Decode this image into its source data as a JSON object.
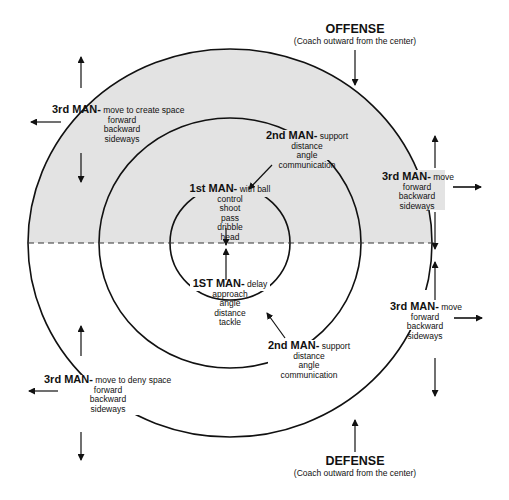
{
  "offense": {
    "title": "OFFENSE",
    "subtitle": "(Coach outward from the center)"
  },
  "defense": {
    "title": "DEFENSE",
    "subtitle": "(Coach outward from the center)"
  },
  "colors": {
    "offense_fill": "#e3e3e3",
    "line": "#111111",
    "background": "#ffffff"
  },
  "labels": {
    "off_first": {
      "role": "1st MAN-",
      "desc": "with ball",
      "items": [
        "control",
        "shoot",
        "pass",
        "dribble",
        "head"
      ]
    },
    "off_second": {
      "role": "2nd MAN-",
      "desc": "support",
      "items": [
        "distance",
        "angle",
        "communication"
      ]
    },
    "off_third_left": {
      "role": "3rd MAN-",
      "desc": "move to create space",
      "items": [
        "forward",
        "backward",
        "sideways"
      ]
    },
    "off_third_right": {
      "role": "3rd MAN-",
      "desc": "move",
      "items": [
        "forward",
        "backward",
        "sideways"
      ]
    },
    "def_first": {
      "role": "1ST MAN-",
      "desc": "delay",
      "items": [
        "approach",
        "angle",
        "distance",
        "tackle"
      ]
    },
    "def_second": {
      "role": "2nd MAN-",
      "desc": "support",
      "items": [
        "distance",
        "angle",
        "communication"
      ]
    },
    "def_third_left": {
      "role": "3rd MAN-",
      "desc": "move to deny space",
      "items": [
        "forward",
        "backward",
        "sideways"
      ]
    },
    "def_third_right": {
      "role": "3rd MAN-",
      "desc": "move",
      "items": [
        "forward",
        "backward",
        "sideways"
      ]
    }
  }
}
